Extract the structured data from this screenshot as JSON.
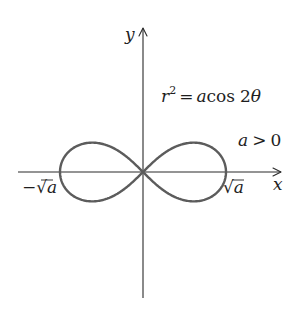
{
  "figure": {
    "equation": {
      "lhs_var": "r",
      "lhs_exp": "2",
      "eq": "=",
      "coef": "a",
      "func": "cos",
      "arg_num": "2",
      "arg_var": "θ"
    },
    "condition": {
      "var": "a",
      "op": ">",
      "value": "0"
    },
    "axes": {
      "x_label": "x",
      "y_label": "y"
    },
    "intercepts": {
      "left": {
        "sign": "−",
        "radical": "√",
        "var": "a"
      },
      "right": {
        "radical": "√",
        "var": "a"
      }
    },
    "colors": {
      "curve": "#5c5c5c",
      "axes": "#2a2a2a",
      "text": "#1e1e1e",
      "background": "#ffffff"
    }
  },
  "chart_data": {
    "type": "line",
    "subtitle": "a > 0",
    "curve": "lemniscate",
    "polar_equation": "r^2 = a*cos(2*theta)",
    "parameter_condition": "a > 0",
    "xlabel": "x",
    "ylabel": "y",
    "x_tick_labels": [
      "-√a",
      "√a"
    ],
    "x_intercepts": [
      "-√a",
      "0",
      "√a"
    ],
    "xlim": [
      "-√a",
      "√a"
    ],
    "max_height_fraction_of_sqrt_a": 0.354,
    "grid": false,
    "legend": "none"
  }
}
